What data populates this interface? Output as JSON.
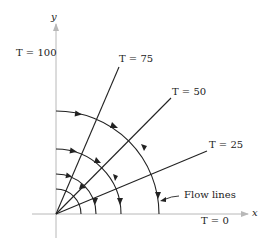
{
  "diagram": {
    "axes": {
      "x_label": "x",
      "y_label": "y"
    },
    "isotherms": [
      {
        "label": "T = 100",
        "var": "T",
        "value": "100"
      },
      {
        "label": "T = 75",
        "var": "T",
        "value": "75"
      },
      {
        "label": "T = 50",
        "var": "T",
        "value": "50"
      },
      {
        "label": "T = 25",
        "var": "T",
        "value": "25"
      },
      {
        "label": "T = 0",
        "var": "T",
        "value": "0"
      }
    ],
    "flow_lines_label": "Flow lines",
    "colors": {
      "lines": "#222222",
      "axes": "#b8b8b8",
      "background": "#ffffff"
    }
  }
}
